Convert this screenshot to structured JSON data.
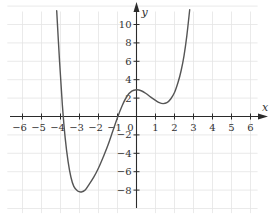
{
  "chart_data": {
    "type": "line",
    "title": "",
    "xlabel": "x",
    "ylabel": "y",
    "xlim": [
      -6.8,
      6.9
    ],
    "ylim": [
      -10.5,
      12.5
    ],
    "grid": true,
    "legend": null,
    "x_ticks": [
      -6,
      -5,
      -4,
      -3,
      -2,
      -1,
      1,
      2,
      3,
      4,
      5,
      6
    ],
    "x_tick_labels": [
      "−6",
      "−5",
      "−4",
      "−3",
      "−2",
      "−1",
      "1",
      "2",
      "3",
      "4",
      "5",
      "6"
    ],
    "y_ticks": [
      -8,
      -6,
      -4,
      -2,
      2,
      4,
      6,
      8,
      10
    ],
    "y_tick_labels": [
      "−8",
      "−6",
      "−4",
      "−2",
      "2",
      "4",
      "6",
      "8",
      "10"
    ],
    "origin_label": "0",
    "series": [
      {
        "name": "f(x)",
        "color": "#555555",
        "x": [
          -4.2,
          -4.05,
          -3.9,
          -3.75,
          -3.6,
          -3.45,
          -3.3,
          -3.1,
          -2.9,
          -2.7,
          -2.5,
          -2.25,
          -2.0,
          -1.75,
          -1.5,
          -1.25,
          -1.0,
          -0.75,
          -0.5,
          -0.25,
          0.0,
          0.25,
          0.5,
          0.75,
          1.0,
          1.2,
          1.4,
          1.6,
          1.8,
          2.0,
          2.2,
          2.35,
          2.5,
          2.65,
          2.8
        ],
        "y": [
          11.5,
          6.0,
          1.2,
          -2.4,
          -4.9,
          -6.6,
          -7.6,
          -8.1,
          -8.2,
          -8.0,
          -7.4,
          -6.6,
          -5.6,
          -4.4,
          -3.1,
          -1.6,
          -0.1,
          1.2,
          2.2,
          2.75,
          2.9,
          2.8,
          2.5,
          2.1,
          1.75,
          1.5,
          1.4,
          1.5,
          1.9,
          2.6,
          3.8,
          5.0,
          6.6,
          8.8,
          11.6
        ]
      }
    ],
    "annotations": [
      {
        "text": "local minimum",
        "x": -2.9,
        "y": -8.2
      },
      {
        "text": "local maximum",
        "x": 0.0,
        "y": 2.9
      },
      {
        "text": "local minimum",
        "x": 1.4,
        "y": 1.4
      }
    ]
  },
  "layout": {
    "origin_px": [
      136.5,
      116.5
    ],
    "px_per_unit_x": 19.0,
    "px_per_unit_y": 9.2
  }
}
